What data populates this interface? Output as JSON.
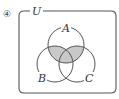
{
  "problem_number": "④",
  "universal_label": "U",
  "sets": [
    {
      "label": "A",
      "cx": 66,
      "cy": 45,
      "r": 18
    },
    {
      "label": "B",
      "cx": 55,
      "cy": 64,
      "r": 18
    },
    {
      "label": "C",
      "cx": 77,
      "cy": 64,
      "r": 18
    }
  ],
  "shaded_region": "A ∩ (B ∪ C)",
  "colors": {
    "stroke": "#555555",
    "shade": "#c8c8c8",
    "background": "#ffffff"
  }
}
